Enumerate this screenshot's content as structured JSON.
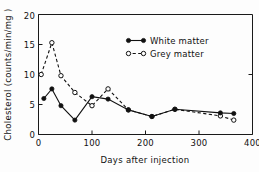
{
  "chart_data": {
    "type": "line",
    "title": "",
    "subtitle": "",
    "xlabel": "Days after injection",
    "ylabel": "Cholesterol  (counts/min/mg )",
    "xlim": [
      0,
      400
    ],
    "ylim": [
      0,
      20
    ],
    "xticks": [
      0,
      100,
      200,
      300,
      400
    ],
    "xtick_labels": [
      "0",
      "100",
      "200",
      "300",
      "400"
    ],
    "yticks": [
      0,
      5,
      10,
      15,
      20
    ],
    "ytick_labels": [
      "0",
      "5",
      "10",
      "15",
      "20"
    ],
    "grid": false,
    "legend_position": "upper-right-inside",
    "series": [
      {
        "name": "White matter",
        "marker": "filled-circle",
        "linestyle": "solid",
        "color": "#111111",
        "x": [
          10,
          25,
          42,
          68,
          100,
          130,
          168,
          212,
          255,
          340,
          365
        ],
        "values": [
          6.0,
          7.6,
          4.8,
          2.4,
          6.3,
          5.9,
          4.1,
          3.0,
          4.2,
          3.6,
          3.5
        ]
      },
      {
        "name": "Grey matter",
        "marker": "open-circle",
        "linestyle": "dashed",
        "color": "#111111",
        "x": [
          5,
          25,
          42,
          68,
          100,
          130,
          168,
          212,
          255,
          340,
          365
        ],
        "values": [
          10.0,
          15.3,
          9.8,
          7.0,
          4.8,
          7.6,
          4.1,
          3.0,
          4.2,
          3.1,
          2.4
        ]
      }
    ]
  },
  "axes": {
    "x_title": "Days after injection",
    "y_title": "Cholesterol  (counts/min/mg )"
  },
  "legend": {
    "entries": [
      {
        "label": "White matter",
        "marker": "filled-circle",
        "line": "solid"
      },
      {
        "label": "Grey matter",
        "marker": "open-circle",
        "line": "dashed"
      }
    ]
  },
  "tick_labels": {
    "x": [
      "0",
      "100",
      "200",
      "300",
      "400"
    ],
    "y": [
      "0",
      "5",
      "10",
      "15",
      "20"
    ]
  }
}
